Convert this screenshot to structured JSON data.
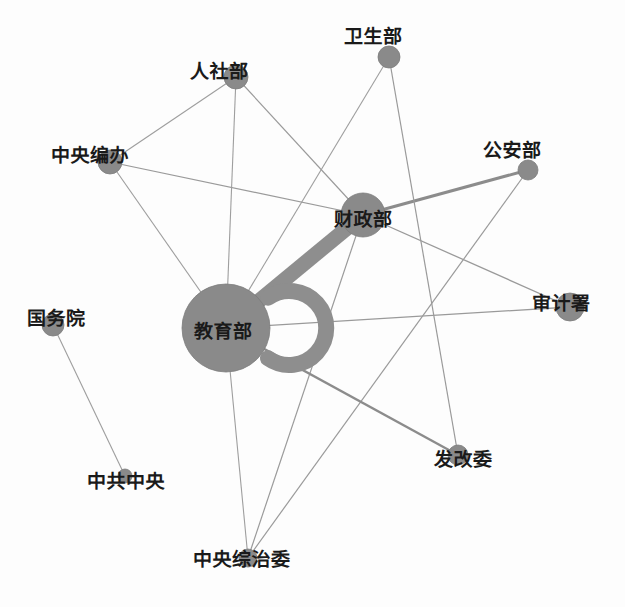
{
  "graph": {
    "type": "network-graph",
    "title": "",
    "background_color": "#fdfdfd",
    "node_color": "#8a8a8a",
    "node_stroke_color": "#7c7c7c",
    "edge_color_thin": "#9a9a9a",
    "edge_color_thick": "#8a8a8a",
    "label_color": "#1a1a1a",
    "width": 625,
    "height": 607,
    "nodes": [
      {
        "id": "rensheb",
        "label": "人社部",
        "x": 236,
        "y": 77,
        "r": 12,
        "label_dx": -46,
        "label_dy": -8,
        "font_size": 19
      },
      {
        "id": "weishengb",
        "label": "卫生部",
        "x": 389,
        "y": 57,
        "r": 11,
        "label_dx": -45,
        "label_dy": -23,
        "font_size": 19
      },
      {
        "id": "zybanb",
        "label": "中央编办",
        "x": 110,
        "y": 162,
        "r": 12,
        "label_dx": -59,
        "label_dy": -9,
        "font_size": 19
      },
      {
        "id": "gonganb",
        "label": "公安部",
        "x": 528,
        "y": 170,
        "r": 10,
        "label_dx": -45,
        "label_dy": -22,
        "font_size": 19
      },
      {
        "id": "caizhengb",
        "label": "财政部",
        "x": 363,
        "y": 215,
        "r": 22,
        "label_dx": -29,
        "label_dy": 2,
        "font_size": 19
      },
      {
        "id": "shenjis",
        "label": "审计署",
        "x": 570,
        "y": 307,
        "r": 14,
        "label_dx": -38,
        "label_dy": -6,
        "font_size": 19
      },
      {
        "id": "jiaoyub",
        "label": "教育部",
        "x": 226,
        "y": 328,
        "r": 44,
        "label_dx": -32,
        "label_dy": 1,
        "font_size": 19
      },
      {
        "id": "guowuyuan",
        "label": "国务院",
        "x": 53,
        "y": 325,
        "r": 11,
        "label_dx": -26,
        "label_dy": -9,
        "font_size": 19
      },
      {
        "id": "zgzhongy",
        "label": "中共中央",
        "x": 125,
        "y": 476,
        "r": 7,
        "label_dx": -38,
        "label_dy": 3,
        "font_size": 19
      },
      {
        "id": "fagaiwei",
        "label": "发改委",
        "x": 458,
        "y": 455,
        "r": 10,
        "label_dx": -24,
        "label_dy": 2,
        "font_size": 19
      },
      {
        "id": "zyzongzhi",
        "label": "中央综治委",
        "x": 248,
        "y": 558,
        "r": 9,
        "label_dx": -55,
        "label_dy": -1,
        "font_size": 19
      }
    ],
    "edges": [
      {
        "source": "rensheb",
        "target": "zybanb",
        "width": 1.1,
        "color": "#9e9e9e"
      },
      {
        "source": "rensheb",
        "target": "jiaoyub",
        "width": 1.1,
        "color": "#9e9e9e"
      },
      {
        "source": "rensheb",
        "target": "caizhengb",
        "width": 1.2,
        "color": "#9a9a9a"
      },
      {
        "source": "zybanb",
        "target": "jiaoyub",
        "width": 1.1,
        "color": "#9e9e9e"
      },
      {
        "source": "zybanb",
        "target": "caizhengb",
        "width": 1.2,
        "color": "#9a9a9a"
      },
      {
        "source": "weishengb",
        "target": "jiaoyub",
        "width": 1.1,
        "color": "#9e9e9e"
      },
      {
        "source": "caizhengb",
        "target": "jiaoyub",
        "width": 15,
        "color": "#8e8e8e"
      },
      {
        "source": "caizhengb",
        "target": "gonganb",
        "width": 3.0,
        "color": "#8c8c8c"
      },
      {
        "source": "caizhengb",
        "target": "shenjis",
        "width": 1.3,
        "color": "#9a9a9a"
      },
      {
        "source": "caizhengb",
        "target": "zyzongzhi",
        "width": 1.2,
        "color": "#9a9a9a"
      },
      {
        "source": "gonganb",
        "target": "zyzongzhi",
        "width": 1.2,
        "color": "#9a9a9a"
      },
      {
        "source": "jiaoyub",
        "target": "shenjis",
        "width": 1.3,
        "color": "#9a9a9a"
      },
      {
        "source": "jiaoyub",
        "target": "fagaiwei",
        "width": 2.4,
        "color": "#8c8c8c"
      },
      {
        "source": "jiaoyub",
        "target": "zyzongzhi",
        "width": 1.1,
        "color": "#9e9e9e"
      },
      {
        "source": "guowuyuan",
        "target": "zgzhongy",
        "width": 1.1,
        "color": "#9e9e9e"
      },
      {
        "source": "weishengb",
        "target": "fagaiwei",
        "width": 1.2,
        "color": "#9a9a9a"
      }
    ],
    "self_loops": [
      {
        "node": "jiaoyub",
        "width": 16,
        "color": "#8e8e8e",
        "radius": 37,
        "angle": 0
      }
    ]
  }
}
